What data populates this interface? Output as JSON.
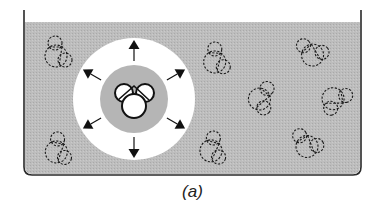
{
  "figure": {
    "caption": "(a)",
    "colors": {
      "liquid": "#bdbdbd",
      "container_outline": "#2a2a2a",
      "exclusion_zone": "#ffffff",
      "solvation_shell": "#b3b3b3",
      "molecule_outline": "#1a1a1a",
      "arrow": "#111111"
    },
    "container": {
      "left": 24,
      "right": 361,
      "liquid_top": 22,
      "bottom": 175,
      "corner_radius": 8
    },
    "center": {
      "x": 134,
      "y": 99,
      "outer_radius": 61,
      "inner_radius": 34
    },
    "arrows": [
      {
        "direction": "up",
        "angle": -90
      },
      {
        "direction": "up-right",
        "angle": -30
      },
      {
        "direction": "down-right",
        "angle": 30
      },
      {
        "direction": "down",
        "angle": 90
      },
      {
        "direction": "down-left",
        "angle": 150
      },
      {
        "direction": "up-left",
        "angle": 210
      }
    ],
    "solvent_molecules": [
      {
        "x": 56,
        "y": 52,
        "rot": 0
      },
      {
        "x": 57,
        "y": 150,
        "rot": 10
      },
      {
        "x": 215,
        "y": 58,
        "rot": 5
      },
      {
        "x": 310,
        "y": 52,
        "rot": -40
      },
      {
        "x": 262,
        "y": 96,
        "rot": 40
      },
      {
        "x": 337,
        "y": 98,
        "rot": 80
      },
      {
        "x": 212,
        "y": 148,
        "rot": 15
      },
      {
        "x": 305,
        "y": 143,
        "rot": -30
      }
    ]
  }
}
